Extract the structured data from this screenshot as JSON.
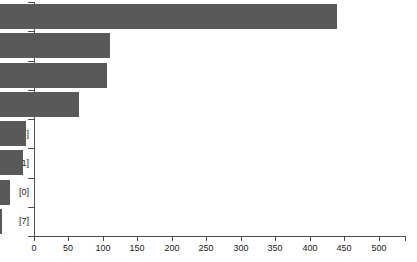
{
  "chart_data": {
    "type": "bar",
    "orientation": "horizontal",
    "title": "",
    "xlabel": "",
    "ylabel": "",
    "categories": [
      "[3]",
      "[4]",
      "[6]",
      "[2]",
      "[5]",
      "[1]",
      "[0]",
      "[7]"
    ],
    "values": [
      488,
      160,
      155,
      114,
      37,
      33,
      14,
      3
    ],
    "xlim": [
      0,
      538
    ],
    "xticks": [
      0,
      50,
      100,
      150,
      200,
      250,
      300,
      350,
      400,
      450,
      500
    ],
    "xticklabels": [
      "0",
      "50",
      "100",
      "150",
      "200",
      "250",
      "300",
      "350",
      "400",
      "450",
      "500"
    ],
    "grid": false,
    "legend": null,
    "bar_color": "#595959",
    "axis_color": "#4d4d4d",
    "background_color": "#ffffff",
    "series": [
      {
        "name": "counts",
        "values": [
          488,
          160,
          155,
          114,
          37,
          33,
          14,
          3
        ]
      }
    ],
    "bars": [
      {
        "category": "[3]",
        "value": 488
      },
      {
        "category": "[4]",
        "value": 160
      },
      {
        "category": "[6]",
        "value": 155
      },
      {
        "category": "[2]",
        "value": 114
      },
      {
        "category": "[5]",
        "value": 37
      },
      {
        "category": "[1]",
        "value": 33
      },
      {
        "category": "[0]",
        "value": 14
      },
      {
        "category": "[7]",
        "value": 3
      }
    ]
  }
}
